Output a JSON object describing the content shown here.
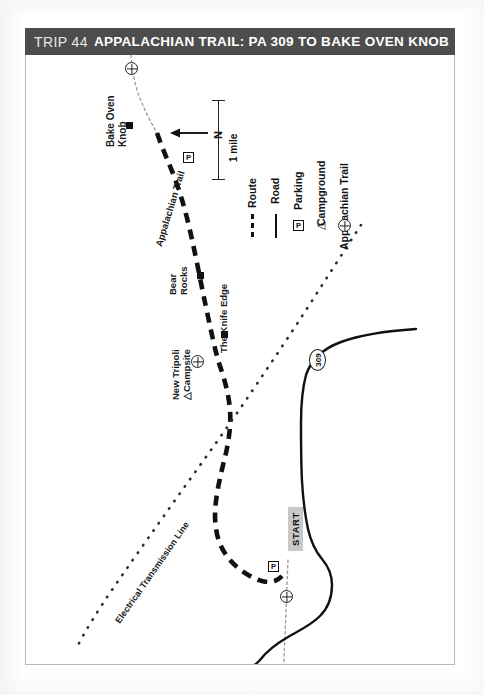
{
  "header": {
    "trip_number": "TRIP 44",
    "title": "APPALACHIAN TRAIL: PA 309 TO BAKE OVEN KNOB",
    "bar_color": "#4d4d4d",
    "text_color": "#ffffff"
  },
  "scale": {
    "label": "1 mile"
  },
  "compass": {
    "label": "N",
    "direction": "left"
  },
  "legend": {
    "items": [
      {
        "label": "Route",
        "symbol": "dashed-line"
      },
      {
        "label": "Road",
        "symbol": "solid-line"
      },
      {
        "label": "Parking",
        "symbol": "parking-box",
        "glyph": "P"
      },
      {
        "label": "Campground",
        "symbol": "triangle",
        "glyph": "△"
      },
      {
        "label": "Appalachian Trail",
        "symbol": "at-shield"
      }
    ]
  },
  "map": {
    "labels": [
      {
        "id": "bake-oven-knob",
        "text": "Bake Oven\nKnob",
        "line1": "Bake Oven",
        "line2": "Knob"
      },
      {
        "id": "appalachian-trail",
        "text": "Appalachian Trail"
      },
      {
        "id": "bear-rocks",
        "line1": "Bear",
        "line2": "Rocks"
      },
      {
        "id": "knife-edge",
        "text": "The Knife Edge"
      },
      {
        "id": "new-tripoli-campsite",
        "line1": "New Tripoli",
        "line2": "△Campsite"
      },
      {
        "id": "electrical-transmission-line",
        "text": "Electrical Transmission Line"
      }
    ],
    "route_shield": "309",
    "start_badge": "START",
    "parking_glyph": "P",
    "campground_glyph": "△",
    "colors": {
      "route": "#111111",
      "road": "#111111",
      "powerline": "#2b2b2b",
      "marker": "#111111",
      "border": "#b9b9b9",
      "start_badge_bg": "#c9c9c9"
    }
  }
}
